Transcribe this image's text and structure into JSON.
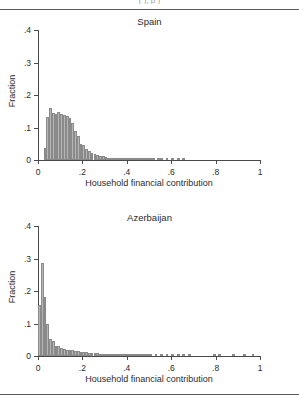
{
  "header": {
    "clipped_text": "(    ),   p                )"
  },
  "panels": [
    {
      "key": "spain",
      "title": "Spain",
      "ylabel": "Fraction",
      "xlabel": "Household financial contribution"
    },
    {
      "key": "azerbaijan",
      "title": "Azerbaijan",
      "ylabel": "Fraction",
      "xlabel": "Household financial contribution"
    }
  ],
  "axes": {
    "yticks": [
      "0",
      ".1",
      ".2",
      ".3",
      ".4"
    ],
    "ytick_values": [
      0,
      0.1,
      0.2,
      0.3,
      0.4
    ],
    "xticks": [
      "0",
      ".2",
      ".4",
      ".6",
      ".8",
      "1"
    ],
    "xtick_values": [
      0,
      0.2,
      0.4,
      0.6,
      0.8,
      1
    ],
    "ylim": [
      0,
      0.4
    ],
    "xlim": [
      0,
      1
    ]
  },
  "colors": {
    "bar_fill": "#b5b5b5",
    "bar_edge": "#8a8a8a",
    "axis": "#4a4a4a",
    "text": "#2b2b2b",
    "rule": "#5a5a5a"
  },
  "chart_data": [
    {
      "type": "bar",
      "title": "Spain",
      "xlabel": "Household financial contribution",
      "ylabel": "Fraction",
      "xlim": [
        0,
        1
      ],
      "ylim": [
        0,
        0.4
      ],
      "grid": false,
      "legend": "none",
      "bin_width": 0.0125,
      "x": [
        0.03125,
        0.04375,
        0.05625,
        0.06875,
        0.08125,
        0.09375,
        0.10625,
        0.11875,
        0.13125,
        0.14375,
        0.15625,
        0.16875,
        0.18125,
        0.19375,
        0.20625,
        0.21875,
        0.23125,
        0.24375,
        0.25625,
        0.26875,
        0.28125,
        0.29375,
        0.30625,
        0.31875,
        0.33125,
        0.34375,
        0.35625,
        0.36875,
        0.38125,
        0.39375,
        0.40625,
        0.41875,
        0.43125,
        0.44375,
        0.45625,
        0.46875,
        0.48125,
        0.49375,
        0.50625,
        0.51875,
        0.54375,
        0.55625,
        0.58125,
        0.60625,
        0.63125,
        0.65625
      ],
      "values": [
        0.038,
        0.132,
        0.16,
        0.146,
        0.142,
        0.147,
        0.143,
        0.14,
        0.135,
        0.128,
        0.113,
        0.088,
        0.073,
        0.05,
        0.046,
        0.033,
        0.027,
        0.022,
        0.019,
        0.015,
        0.013,
        0.013,
        0.009,
        0.007,
        0.005,
        0.004,
        0.003,
        0.003,
        0.002,
        0.002,
        0.002,
        0.002,
        0.001,
        0.001,
        0.001,
        0.001,
        0.001,
        0.001,
        0.001,
        0.001,
        0.001,
        0.001,
        0.001,
        0.001,
        0.001,
        0.001
      ]
    },
    {
      "type": "bar",
      "title": "Azerbaijan",
      "xlabel": "Household financial contribution",
      "ylabel": "Fraction",
      "xlim": [
        0,
        1
      ],
      "ylim": [
        0,
        0.4
      ],
      "grid": false,
      "legend": "none",
      "bin_width": 0.0125,
      "x": [
        0.00625,
        0.01875,
        0.03125,
        0.04375,
        0.05625,
        0.06875,
        0.08125,
        0.09375,
        0.10625,
        0.11875,
        0.13125,
        0.14375,
        0.15625,
        0.16875,
        0.18125,
        0.19375,
        0.20625,
        0.21875,
        0.23125,
        0.24375,
        0.25625,
        0.26875,
        0.28125,
        0.29375,
        0.30625,
        0.31875,
        0.33125,
        0.34375,
        0.35625,
        0.36875,
        0.38125,
        0.39375,
        0.40625,
        0.41875,
        0.43125,
        0.44375,
        0.45625,
        0.46875,
        0.48125,
        0.49375,
        0.50625,
        0.53125,
        0.55625,
        0.58125,
        0.60625,
        0.63125,
        0.65625,
        0.68125,
        0.79375,
        0.81875,
        0.88125,
        0.93125,
        0.96875
      ],
      "values": [
        0.158,
        0.285,
        0.183,
        0.098,
        0.052,
        0.046,
        0.032,
        0.03,
        0.026,
        0.022,
        0.02,
        0.019,
        0.018,
        0.016,
        0.014,
        0.013,
        0.012,
        0.011,
        0.01,
        0.009,
        0.008,
        0.008,
        0.007,
        0.007,
        0.006,
        0.006,
        0.006,
        0.005,
        0.005,
        0.005,
        0.004,
        0.004,
        0.004,
        0.003,
        0.003,
        0.003,
        0.003,
        0.002,
        0.002,
        0.002,
        0.002,
        0.002,
        0.002,
        0.002,
        0.002,
        0.001,
        0.001,
        0.001,
        0.001,
        0.001,
        0.001,
        0.001,
        0.001
      ]
    }
  ]
}
